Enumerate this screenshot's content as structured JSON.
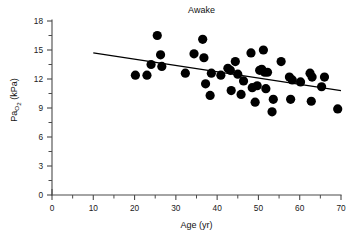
{
  "chart_data": {
    "type": "scatter",
    "title": "Awake",
    "xlabel": "Age (yr)",
    "ylabel": "PaO2 (kPa)",
    "ylabel_main": "Pa",
    "ylabel_sub": "O",
    "ylabel_sub2": "2",
    "ylabel_units": " (kPa)",
    "xlim": [
      0,
      70
    ],
    "ylim": [
      0,
      18
    ],
    "xticks": [
      0,
      10,
      20,
      30,
      40,
      50,
      60,
      70
    ],
    "xtick_labels": [
      "0",
      "10",
      "20",
      "30",
      "40",
      "50",
      "60",
      "70"
    ],
    "xminor_ticks": [
      5,
      15,
      25,
      35,
      45,
      55,
      65
    ],
    "yticks": [
      0,
      3,
      6,
      9,
      12,
      15,
      18
    ],
    "ytick_labels": [
      "0",
      "3",
      "6",
      "9",
      "12",
      "15",
      "18"
    ],
    "yminor_ticks": [
      1.5,
      4.5,
      7.5,
      10.5,
      13.5,
      16.5
    ],
    "grid": false,
    "legend": null,
    "marker": "filled-circle",
    "marker_color": "#000000",
    "marker_size_px": 4.6,
    "points": [
      {
        "x": 20.2,
        "y": 12.4
      },
      {
        "x": 23.0,
        "y": 12.4
      },
      {
        "x": 24.0,
        "y": 13.5
      },
      {
        "x": 25.5,
        "y": 16.5
      },
      {
        "x": 26.3,
        "y": 14.5
      },
      {
        "x": 26.6,
        "y": 13.3
      },
      {
        "x": 32.3,
        "y": 12.6
      },
      {
        "x": 34.4,
        "y": 14.6
      },
      {
        "x": 36.5,
        "y": 16.1
      },
      {
        "x": 36.8,
        "y": 14.2
      },
      {
        "x": 37.2,
        "y": 11.5
      },
      {
        "x": 38.3,
        "y": 10.3
      },
      {
        "x": 38.6,
        "y": 12.6
      },
      {
        "x": 40.9,
        "y": 12.4
      },
      {
        "x": 42.6,
        "y": 13.1
      },
      {
        "x": 43.2,
        "y": 12.9
      },
      {
        "x": 43.4,
        "y": 10.8
      },
      {
        "x": 44.4,
        "y": 13.8
      },
      {
        "x": 45.0,
        "y": 12.5
      },
      {
        "x": 45.8,
        "y": 10.4
      },
      {
        "x": 46.4,
        "y": 11.8
      },
      {
        "x": 48.2,
        "y": 14.7
      },
      {
        "x": 48.5,
        "y": 11.1
      },
      {
        "x": 49.2,
        "y": 9.6
      },
      {
        "x": 49.7,
        "y": 11.3
      },
      {
        "x": 50.3,
        "y": 12.9
      },
      {
        "x": 50.8,
        "y": 13.0
      },
      {
        "x": 51.2,
        "y": 15.0
      },
      {
        "x": 51.5,
        "y": 12.7
      },
      {
        "x": 51.8,
        "y": 11.0
      },
      {
        "x": 52.2,
        "y": 12.7
      },
      {
        "x": 53.3,
        "y": 8.6
      },
      {
        "x": 53.6,
        "y": 9.9
      },
      {
        "x": 55.5,
        "y": 13.8
      },
      {
        "x": 57.5,
        "y": 12.2
      },
      {
        "x": 57.8,
        "y": 9.9
      },
      {
        "x": 58.2,
        "y": 11.9
      },
      {
        "x": 60.2,
        "y": 11.7
      },
      {
        "x": 62.5,
        "y": 12.6
      },
      {
        "x": 62.8,
        "y": 9.7
      },
      {
        "x": 63.0,
        "y": 12.2
      },
      {
        "x": 65.3,
        "y": 11.2
      },
      {
        "x": 66.0,
        "y": 12.2
      },
      {
        "x": 69.2,
        "y": 8.9
      }
    ],
    "fit_line": {
      "x_start": 10,
      "y_start": 14.7,
      "x_end": 70,
      "y_end": 10.8,
      "color": "#000000"
    }
  }
}
